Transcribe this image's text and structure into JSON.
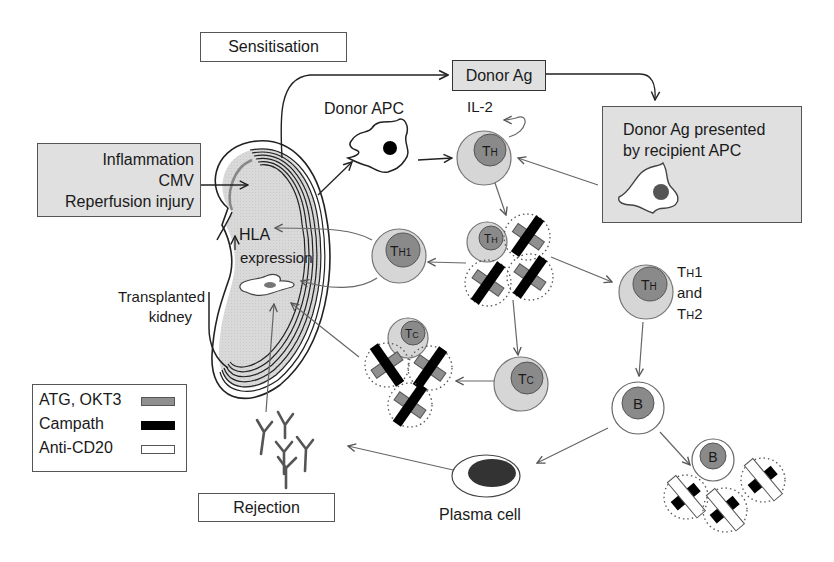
{
  "boxes": {
    "sensitisation": "Sensitisation",
    "donor_ag": "Donor Ag",
    "insults": [
      "Inflammation",
      "CMV",
      "Reperfusion injury"
    ],
    "donor_ag_presented": [
      "Donor Ag presented",
      "by recipient APC"
    ],
    "rejection": "Rejection"
  },
  "labels": {
    "donor_apc": "Donor APC",
    "il2": "IL-2",
    "hla": "HLA",
    "expression": "expression",
    "transplanted_kidney": [
      "Transplanted",
      "kidney"
    ],
    "th1_and_th2": [
      "TH1",
      "and",
      "TH2"
    ],
    "plasma_cell": "Plasma cell"
  },
  "cells": {
    "th_top": {
      "main": "T",
      "sub": "H"
    },
    "th_center": {
      "main": "T",
      "sub": "H"
    },
    "th1": {
      "main": "T",
      "sub": "H1"
    },
    "th_right": {
      "main": "T",
      "sub": "H"
    },
    "tc_cluster": {
      "main": "T",
      "sub": "C"
    },
    "tc_single": {
      "main": "T",
      "sub": "C"
    },
    "b_single": "B",
    "b_cluster": "B"
  },
  "legend": {
    "items": [
      {
        "label": "ATG, OKT3",
        "color": "#8f8f8f",
        "border": "#555555"
      },
      {
        "label": "Campath",
        "color": "#000000",
        "border": "#000000"
      },
      {
        "label": "Anti-CD20",
        "color": "#ffffff",
        "border": "#555555"
      }
    ]
  },
  "colors": {
    "cell_outer": "#d6d6d6",
    "cell_inner": "#8a8a8a",
    "box_grey": "#e0e0e0",
    "kidney_fill": "#d9d9d9",
    "arrow": "#666666"
  }
}
